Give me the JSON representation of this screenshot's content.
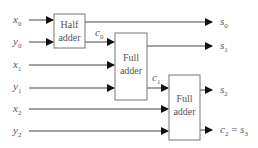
{
  "diagram": {
    "type": "ripple-carry adder block diagram",
    "inputs": [
      {
        "var": "x",
        "sub": "0"
      },
      {
        "var": "y",
        "sub": "0"
      },
      {
        "var": "x",
        "sub": "1"
      },
      {
        "var": "y",
        "sub": "1"
      },
      {
        "var": "x",
        "sub": "2"
      },
      {
        "var": "y",
        "sub": "2"
      }
    ],
    "blocks": [
      {
        "line1": "Half",
        "line2": "adder"
      },
      {
        "line1": "Full",
        "line2": "adder"
      },
      {
        "line1": "Full",
        "line2": "adder"
      }
    ],
    "carries": [
      {
        "var": "c",
        "sub": "0"
      },
      {
        "var": "c",
        "sub": "1"
      }
    ],
    "outputs": [
      {
        "var": "s",
        "sub": "0"
      },
      {
        "var": "s",
        "sub": "1"
      },
      {
        "var": "s",
        "sub": "2"
      },
      {
        "var": "c",
        "sub": "2",
        "eq": " = ",
        "var2": "s",
        "sub2": "3"
      }
    ],
    "colors": {
      "line": "#444444",
      "text": "#555555",
      "box": "#777777"
    }
  }
}
